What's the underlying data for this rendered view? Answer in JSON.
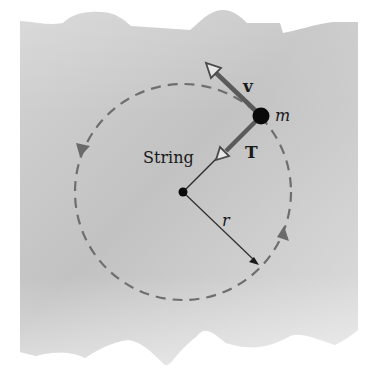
{
  "figure": {
    "type": "physics-diagram",
    "labels": {
      "string": "String",
      "velocity": "v",
      "tension": "T",
      "mass": "m",
      "radius": "r"
    },
    "colors": {
      "surface_light": "#d9d9d9",
      "surface_dark": "#bdbdbd",
      "background": "#ffffff",
      "dashed_path": "#6e6e6e",
      "vector_arrow": "#5a5a5a",
      "string_line": "#2e2e2e",
      "mass": "#0a0a0a",
      "text": "#1a1a1a"
    },
    "geometry": {
      "circle_center": [
        183,
        192
      ],
      "circle_radius": 108,
      "mass_position": [
        261,
        116
      ],
      "mass_radius": 8,
      "velocity_tip": [
        206,
        63
      ],
      "tension_tip": [
        216,
        159
      ],
      "radius_tip": [
        258,
        264
      ]
    },
    "direction_of_motion": "counterclockwise"
  }
}
